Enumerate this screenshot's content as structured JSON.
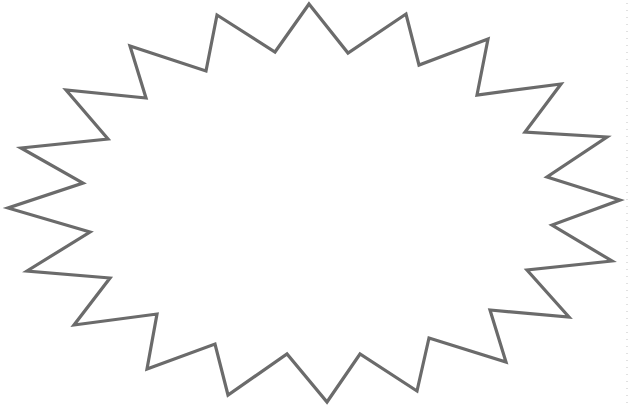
{
  "shape": {
    "type": "starburst",
    "fill": "#ffffff",
    "stroke": "#6b6b6b",
    "stroke_width": 3.2,
    "points": "309,4 348,53 406,14 419,65 488,39 477,95 561,84 525,132 607,137 547,177 620,200 552,225 612,261 527,270 569,317 490,310 506,362 429,338 417,391 360,354 327,402 287,354 228,395 215,344 147,369 157,314 74,325 110,278 27,271 90,232 8,208 83,183 21,148 108,139 66,90 146,98 130,46 206,71 217,15 275,52"
  },
  "edge_guide": {
    "color": "#d9d9d9"
  }
}
